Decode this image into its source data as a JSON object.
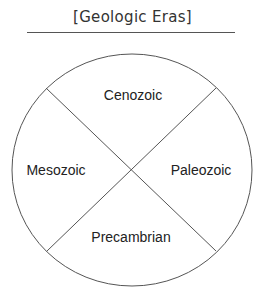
{
  "title": "[Geologic Eras]",
  "diagram": {
    "type": "quadrant-circle",
    "sections": [
      {
        "position": "top",
        "label": "Cenozoic"
      },
      {
        "position": "left",
        "label": "Mesozoic"
      },
      {
        "position": "right",
        "label": "Paleozoic"
      },
      {
        "position": "bottom",
        "label": "Precambrian"
      }
    ],
    "line_color": "#555555"
  }
}
